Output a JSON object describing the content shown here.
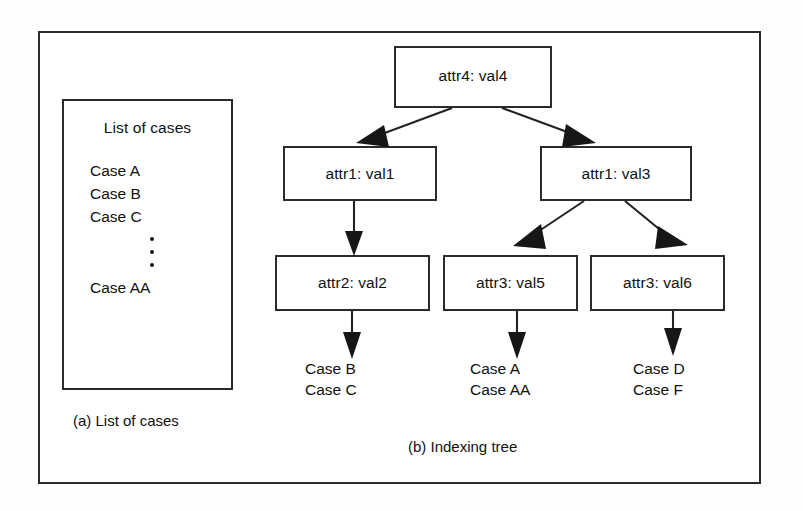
{
  "figure": {
    "panel_a": {
      "caption": "(a) List of cases",
      "box_title": "List of cases",
      "cases": [
        "Case A",
        "Case B",
        "Case C"
      ],
      "ellipsis": "vertical-dots",
      "last_case": "Case AA"
    },
    "panel_b": {
      "caption": "(b) Indexing tree",
      "nodes": {
        "root": "attr4: val4",
        "left_1": "attr1: val1",
        "right_1": "attr1: val3",
        "left_2": "attr2: val2",
        "mid_2": "attr3: val5",
        "right_2": "attr3: val6"
      },
      "leaves": [
        {
          "lines": [
            "Case B",
            "Case C"
          ]
        },
        {
          "lines": [
            "Case A",
            "Case AA"
          ]
        },
        {
          "lines": [
            "Case D",
            "Case F"
          ]
        }
      ]
    }
  },
  "colors": {
    "stroke": "#2b2b2b",
    "text": "#111111",
    "background": "#ffffff"
  }
}
